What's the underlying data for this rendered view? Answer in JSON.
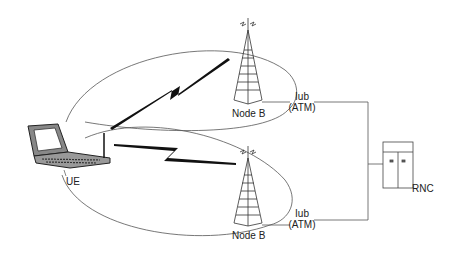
{
  "diagram": {
    "type": "UMTS radio access network",
    "nodes": {
      "ue": {
        "label": "UE"
      },
      "node_b_top": {
        "label": "Node B"
      },
      "node_b_bottom": {
        "label": "Node B"
      },
      "rnc": {
        "label": "RNC"
      }
    },
    "links": {
      "iub_top": {
        "line1": "Iub",
        "line2": "(ATM)"
      },
      "iub_bottom": {
        "line1": "Iub",
        "line2": "(ATM)"
      }
    },
    "colors": {
      "line": "#555555",
      "bolt": "#111111",
      "tower": "#333333"
    }
  }
}
